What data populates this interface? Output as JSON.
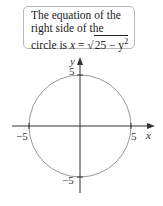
{
  "callout": {
    "line1": "The equation of the",
    "line2": "right side of the",
    "line3_prefix": "circle is ",
    "var_x": "x",
    "equals": " = ",
    "radical": "√",
    "radicand": "25 − y",
    "exponent": "2"
  },
  "diagram": {
    "x_axis_label": "x",
    "y_axis_label": "y",
    "x_tick_neg": "−5",
    "x_tick_pos": "5",
    "y_tick_pos": "5",
    "y_tick_neg": "−5",
    "circle_radius": 5,
    "colors": {
      "axis": "#333333",
      "circle": "#999999",
      "border": "#b8b8b8"
    }
  }
}
